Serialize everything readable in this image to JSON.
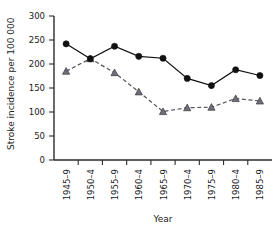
{
  "chart_data": {
    "type": "line",
    "title": "",
    "xlabel": "Year",
    "ylabel": "Stroke incidence per 100 000",
    "categories": [
      "1945–9",
      "1950–4",
      "1955–9",
      "1960–4",
      "1965–9",
      "1970–4",
      "1975–9",
      "1980–4",
      "1985–9"
    ],
    "ylim": [
      0,
      300
    ],
    "yticks": [
      0,
      50,
      100,
      150,
      200,
      250,
      300
    ],
    "ytick_labels": [
      "0",
      "50",
      "100",
      "150",
      "200",
      "250",
      "300"
    ],
    "grid": false,
    "legend": "none",
    "series": [
      {
        "name": "series-circles",
        "marker": "circle",
        "line_style": "solid",
        "color": "#111111",
        "values": [
          242,
          211,
          237,
          216,
          212,
          170,
          155,
          188,
          176
        ]
      },
      {
        "name": "series-triangles",
        "marker": "triangle",
        "line_style": "dashed",
        "color": "#6e6e78",
        "values": [
          185,
          211,
          182,
          142,
          101,
          109,
          110,
          128,
          123
        ]
      }
    ]
  },
  "axes": {
    "x_title": "Year",
    "y_title": "Stroke incidence per 100 000"
  },
  "ticks": {
    "y": [
      "300",
      "250",
      "200",
      "150",
      "100",
      "50",
      "0"
    ],
    "x": [
      "1945–9",
      "1950–4",
      "1955–9",
      "1960–4",
      "1965–9",
      "1970–4",
      "1975–9",
      "1980–4",
      "1985–9"
    ]
  }
}
